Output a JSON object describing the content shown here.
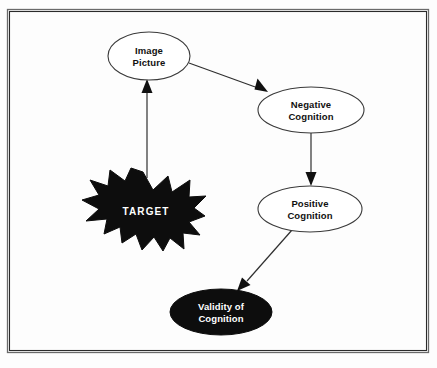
{
  "figure": {
    "background_color": "#fdfdfd",
    "frame_color": "#2b2b2b",
    "accent_dark": "#0d0d0d",
    "line_color": "#2f2f2f"
  },
  "diagram_data": {
    "type": "flow-diagram",
    "nodes": [
      {
        "id": "image-picture",
        "shape": "ellipse",
        "style": "outline",
        "lines": [
          "Image",
          "Picture"
        ],
        "cx": 149,
        "cy": 56,
        "rx": 41,
        "ry": 24,
        "text_color": "#111111",
        "fill": "#ffffff"
      },
      {
        "id": "negative-cognition",
        "shape": "ellipse",
        "style": "outline",
        "lines": [
          "Negative",
          "Cognition"
        ],
        "cx": 311,
        "cy": 110,
        "rx": 53,
        "ry": 23,
        "text_color": "#111111",
        "fill": "#ffffff"
      },
      {
        "id": "positive-cognition",
        "shape": "ellipse",
        "style": "outline",
        "lines": [
          "Positive",
          "Cognition"
        ],
        "cx": 310,
        "cy": 209,
        "rx": 52,
        "ry": 23,
        "text_color": "#111111",
        "fill": "#ffffff"
      },
      {
        "id": "validity-of-cognition",
        "shape": "ellipse",
        "style": "filled",
        "lines": [
          "Validity of",
          "Cognition"
        ],
        "cx": 221,
        "cy": 312,
        "rx": 51,
        "ry": 23,
        "text_color": "#ffffff",
        "fill": "#0d0d0d"
      },
      {
        "id": "target",
        "shape": "starburst",
        "style": "filled",
        "lines": [
          "TARGET"
        ],
        "cx": 144,
        "cy": 211,
        "text_color": "#ffffff",
        "fill": "#0d0d0d"
      }
    ],
    "edges": [
      {
        "id": "target-to-image",
        "from": "target",
        "to": "image-picture",
        "direction": "up"
      },
      {
        "id": "image-to-negative",
        "from": "image-picture",
        "to": "negative-cognition",
        "direction": "down-right"
      },
      {
        "id": "negative-to-positive",
        "from": "negative-cognition",
        "to": "positive-cognition",
        "direction": "down"
      },
      {
        "id": "positive-to-validity",
        "from": "positive-cognition",
        "to": "validity-of-cognition",
        "direction": "down-left"
      }
    ]
  }
}
